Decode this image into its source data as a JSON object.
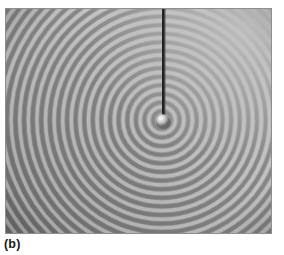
{
  "figure": {
    "caption": "(b)",
    "kind": "photograph",
    "plate": {
      "x": 5,
      "y": 8,
      "width": 267,
      "height": 226,
      "base_gray": "#9a9a9a",
      "corner_light": "#b4b4b4",
      "corner_dark": "#7a7a7a",
      "border_color": "#8c8c8c"
    }
  },
  "photo_content": {
    "source": {
      "label": "vibrating-ball-source",
      "cx": 157,
      "cy": 112,
      "radius": 6,
      "highlight_color": "#e6e6e6",
      "shadow_color": "#3a3a3a"
    },
    "rod": {
      "label": "vertical-support-rod",
      "x": 158,
      "y_top": 0,
      "y_bottom": 110,
      "width": 2.6,
      "color": "#1f1f1f"
    },
    "waves": {
      "label": "concentric-circular-wavefronts",
      "count": 26,
      "wavelength_px": 8.6,
      "first_radius_px": 9,
      "crest_color": "#d2d2d2",
      "trough_color": "#6e6e6e",
      "fade_start_px": 60,
      "fade_end_px": 230
    },
    "illumination": {
      "bright_direction": "top-right",
      "dark_direction": "bottom-left",
      "bright_hex": "#bcbcbc",
      "dark_hex": "#777777"
    }
  }
}
